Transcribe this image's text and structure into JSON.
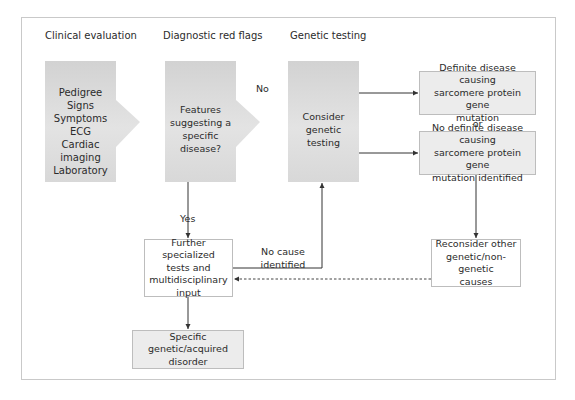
{
  "columns": [
    {
      "title": "Clinical evaluation"
    },
    {
      "title": "Diagnostic red flags"
    },
    {
      "title": "Genetic testing"
    }
  ],
  "nodes": {
    "clinical": {
      "lines": "Pedigree\nSigns\nSymptoms\nECG\nCardiac imaging\nLaboratory"
    },
    "features": {
      "text": "Features\nsuggesting a\nspecific disease?"
    },
    "genetic": {
      "text": "Consider\ngenetic testing"
    },
    "definite": {
      "text": "Definite disease causing\nsarcomere protein gene\nmutation"
    },
    "no_definite": {
      "text": "No definite disease causing\nsarcomere protein gene\nmutation identified"
    },
    "further": {
      "text": "Further specialized\ntests and\nmultidisciplinary\ninput"
    },
    "specific": {
      "text": "Specific genetic/acquired\ndisorder"
    },
    "reconsider": {
      "text": "Reconsider other\ngenetic/non-genetic\ncauses"
    }
  },
  "edge_labels": {
    "no": "No",
    "yes": "Yes",
    "or": "or",
    "no_cause": "No cause\nidentified"
  },
  "colors": {
    "box_fill": "#dcdcdc",
    "box_border": "#bdbdbd",
    "line": "#333333",
    "frame": "#c9c9c9"
  }
}
